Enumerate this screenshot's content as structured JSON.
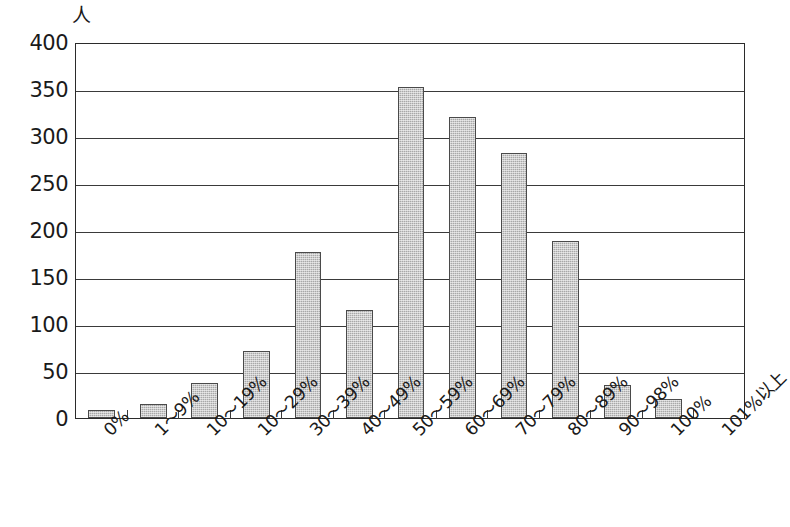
{
  "chart_data": {
    "type": "bar",
    "title": "",
    "subtitle": "",
    "xlabel": "",
    "ylabel": "人",
    "ylim": [
      0,
      400
    ],
    "ytick_step": 50,
    "yticks": [
      400,
      350,
      300,
      250,
      200,
      150,
      100,
      50,
      0
    ],
    "ytick_labels": [
      "400",
      "350",
      "300",
      "250",
      "200",
      "150",
      "100",
      "50",
      "0"
    ],
    "grid": true,
    "grid_axis": "y",
    "legend": false,
    "legend_position": "none",
    "categories": [
      "0%",
      "1〜9%",
      "10〜19%",
      "10〜29%",
      "30〜39%",
      "40〜49%",
      "50〜59%",
      "60〜69%",
      "70〜79%",
      "80〜89%",
      "90〜98%",
      "100%",
      "101%以上"
    ],
    "values": [
      9,
      15,
      37,
      71,
      177,
      115,
      352,
      320,
      282,
      188,
      35,
      20,
      0
    ],
    "series": [
      {
        "name": "人数",
        "values": [
          9,
          15,
          37,
          71,
          177,
          115,
          352,
          320,
          282,
          188,
          35,
          20,
          0
        ]
      }
    ],
    "bar_color": "#a8a8a8",
    "bar_edge_color": "#4a4a4a",
    "axis_color": "#2b2b2b",
    "background_color": "#ffffff",
    "xtick_label_rotation": -45
  },
  "axis": {
    "unit_label": "人"
  }
}
